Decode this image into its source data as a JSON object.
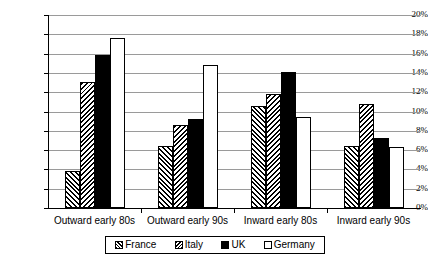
{
  "chart_data": {
    "type": "bar",
    "title": "",
    "subtitle": "",
    "xlabel": "",
    "ylabel": "",
    "categories": [
      "Outward early 80s",
      "Outward early 90s",
      "Inward early 80s",
      "Inward early 90s"
    ],
    "series": [
      {
        "name": "France",
        "values": [
          3.8,
          6.4,
          10.6,
          6.4
        ]
      },
      {
        "name": "Italy",
        "values": [
          13.1,
          8.6,
          11.8,
          10.8
        ]
      },
      {
        "name": "UK",
        "values": [
          15.9,
          9.2,
          14.1,
          7.3
        ]
      },
      {
        "name": "Germany",
        "values": [
          17.6,
          14.8,
          9.4,
          6.3
        ]
      }
    ],
    "ylim": [
      0,
      20
    ],
    "ytick_step": 2,
    "ytick_labels": [
      "0%",
      "2%",
      "4%",
      "6%",
      "8%",
      "10%",
      "12%",
      "14%",
      "16%",
      "18%",
      "20%"
    ],
    "ytick_values": [
      0,
      2,
      4,
      6,
      8,
      10,
      12,
      14,
      16,
      18,
      20
    ],
    "grid": true,
    "grid_axis": "y",
    "legend_position": "bottom",
    "legend_entries": [
      "France",
      "Italy",
      "UK",
      "Germany"
    ],
    "series_fills": {
      "France": "diagonal-hatch-forward",
      "Italy": "diagonal-hatch-backward",
      "UK": "solid-black",
      "Germany": "solid-white"
    },
    "colors": {
      "axis": "#000000",
      "gridline": "#9a9a9a",
      "background": "#ffffff",
      "uk_fill": "#000000",
      "germany_fill": "#ffffff",
      "hatch": "#000000"
    }
  }
}
